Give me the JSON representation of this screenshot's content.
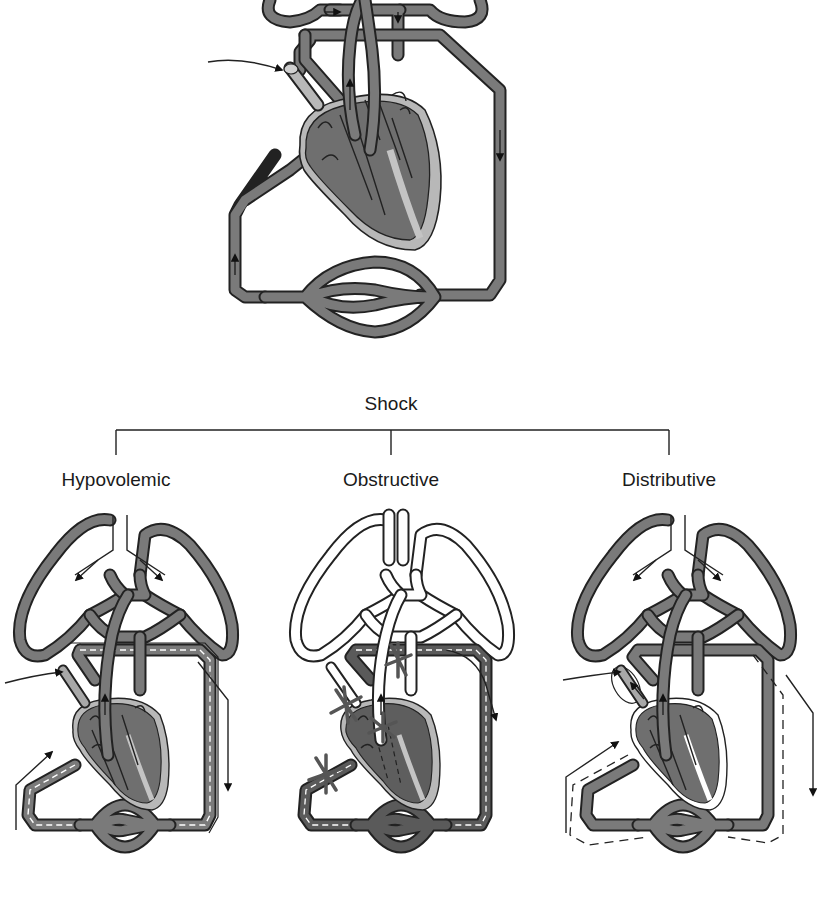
{
  "title": "Shock",
  "categories": [
    {
      "label": "Hypovolemic",
      "x": 116
    },
    {
      "label": "Obstructive",
      "x": 391
    },
    {
      "label": "Distributive",
      "x": 669
    }
  ],
  "colors": {
    "vessel_fill": "#7a7a7a",
    "vessel_outline": "#222222",
    "heart_fill": "#6f6f6f",
    "heart_wall": "#b8b8b8",
    "obstructed_vessel": "#ffffff",
    "x_mark": "#555555"
  },
  "diagrams": [
    {
      "name": "normal-circulation",
      "description": "Normal heart, lungs, systemic and capillary circulation"
    },
    {
      "name": "hypovolemic",
      "description": "Reduced volume (dashed inner line) in systemic vessels"
    },
    {
      "name": "obstructive",
      "description": "Obstruction points marked with X; pulmonary circuit empty"
    },
    {
      "name": "distributive",
      "description": "Vessel dilation shown by dashed outer line"
    }
  ]
}
